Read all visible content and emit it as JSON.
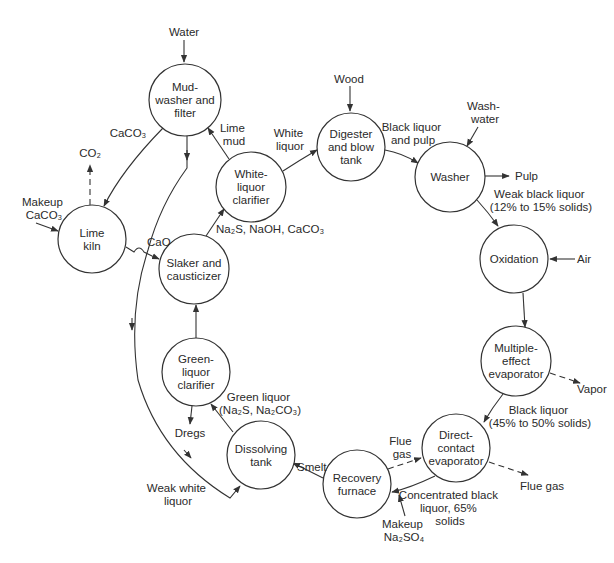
{
  "diagram": {
    "type": "process-flow",
    "nodes": [
      {
        "id": "mud_washer",
        "lines": [
          "Mud-",
          "washer and",
          "filter"
        ],
        "cx": 185,
        "cy": 100,
        "r": 36
      },
      {
        "id": "lime_kiln",
        "lines": [
          "Lime",
          "kiln"
        ],
        "cx": 92,
        "cy": 239,
        "r": 34
      },
      {
        "id": "white_liquor_clarifier",
        "lines": [
          "White-",
          "liquor",
          "clarifier"
        ],
        "cx": 251,
        "cy": 187,
        "r": 35
      },
      {
        "id": "slaker",
        "lines": [
          "Slaker and",
          "causticizer"
        ],
        "cx": 194,
        "cy": 269,
        "r": 35
      },
      {
        "id": "green_liquor_clarifier",
        "lines": [
          "Green-",
          "liquor",
          "clarifier"
        ],
        "cx": 196,
        "cy": 372,
        "r": 34
      },
      {
        "id": "dissolving_tank",
        "lines": [
          "Dissolving",
          "tank"
        ],
        "cx": 261,
        "cy": 455,
        "r": 34
      },
      {
        "id": "recovery_furnace",
        "lines": [
          "Recovery",
          "furnace"
        ],
        "cx": 357,
        "cy": 484,
        "r": 34
      },
      {
        "id": "direct_contact_evaporator",
        "lines": [
          "Direct-",
          "contact",
          "evaporator"
        ],
        "cx": 456,
        "cy": 448,
        "r": 34
      },
      {
        "id": "multiple_effect_evaporator",
        "lines": [
          "Multiple-",
          "effect",
          "evaporator"
        ],
        "cx": 516,
        "cy": 361,
        "r": 35
      },
      {
        "id": "oxidation",
        "lines": [
          "Oxidation"
        ],
        "cx": 514,
        "cy": 259,
        "r": 34
      },
      {
        "id": "washer",
        "lines": [
          "Washer"
        ],
        "cx": 450,
        "cy": 177,
        "r": 35
      },
      {
        "id": "digester",
        "lines": [
          "Digester",
          "and blow",
          "tank"
        ],
        "cx": 351,
        "cy": 147,
        "r": 34
      }
    ],
    "labels": {
      "water": [
        "Water"
      ],
      "caco3_to_kiln": [
        "CaCO₃"
      ],
      "co2": [
        "CO₂"
      ],
      "makeup_caco3": [
        "Makeup",
        "CaCO₃"
      ],
      "lime_mud": [
        "Lime",
        "mud"
      ],
      "white_liquor": [
        "White",
        "liquor"
      ],
      "cao": [
        "CaO"
      ],
      "na2s_naoh_caco3": [
        "Na₂S, NaOH, CaCO₃"
      ],
      "wood": [
        "Wood"
      ],
      "black_liquor_and_pulp": [
        "Black liquor",
        "and pulp"
      ],
      "wash_water": [
        "Wash-",
        "water"
      ],
      "pulp": [
        "Pulp"
      ],
      "weak_black_liquor": [
        "Weak black liquor",
        "(12% to 15% solids)"
      ],
      "air": [
        "Air"
      ],
      "vapor": [
        "Vapor"
      ],
      "black_liquor_45_50": [
        "Black liquor",
        "(45% to 50% solids)"
      ],
      "flue_gas_in": [
        "Flue",
        "gas"
      ],
      "flue_gas_out": [
        "Flue gas"
      ],
      "concentrated_black_liquor": [
        "Concentrated black",
        "liquor, 65%",
        "solids"
      ],
      "makeup_na2so4": [
        "Makeup",
        "Na₂SO₄"
      ],
      "smelt": [
        "Smelt"
      ],
      "green_liquor": [
        "Green liquor",
        "(Na₂S, Na₂CO₃)"
      ],
      "dregs": [
        "Dregs"
      ],
      "weak_white_liquor": [
        "Weak white",
        "liquor"
      ]
    },
    "colors": {
      "stroke": "#333333",
      "text": "#2a2a2a",
      "background": "#ffffff"
    }
  }
}
